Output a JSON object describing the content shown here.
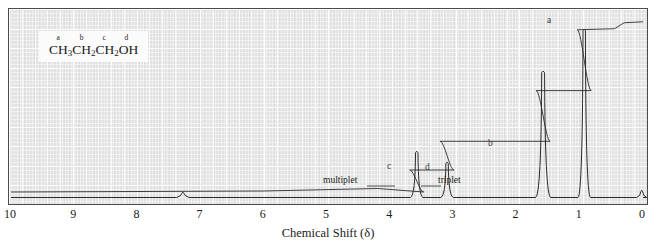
{
  "figure": {
    "compound_label": {
      "letters": [
        {
          "text": "a",
          "pos": 0.085
        },
        {
          "text": "b",
          "pos": 0.345
        },
        {
          "text": "c",
          "pos": 0.6
        },
        {
          "text": "d",
          "pos": 0.845
        }
      ],
      "formula_parts": [
        {
          "text": "CH",
          "sub": "3"
        },
        {
          "text": "CH",
          "sub": "2"
        },
        {
          "text": "CH",
          "sub": "2"
        },
        {
          "text": "OH",
          "sub": ""
        }
      ],
      "formula_plain": "CH3CH2CH2OH"
    },
    "annotations": [
      {
        "name": "multiplet",
        "text": "multiplet",
        "x": 322,
        "y": 180,
        "line_to": 385
      },
      {
        "name": "triplet",
        "text": "triplet",
        "x": 437,
        "y": 180,
        "line_from": 412
      }
    ],
    "peak_letters": [
      {
        "text": "a",
        "x": 546,
        "y": 14
      },
      {
        "text": "b",
        "x": 487,
        "y": 137
      },
      {
        "text": "c",
        "x": 386,
        "y": 160
      },
      {
        "text": "d",
        "x": 424,
        "y": 161
      }
    ],
    "colors": {
      "plot_background": "#e2e2e2",
      "grid": "#ffffff",
      "trace": "#2b2b2b",
      "frame": "#4a4a4a",
      "text": "#1a1a1a"
    }
  },
  "chart_data": {
    "type": "line",
    "title": "",
    "xlabel": "Chemical Shift (δ)",
    "ylabel": "",
    "unit_label": "ppm",
    "xlim": [
      10,
      0
    ],
    "x_tick_labels": [
      "10",
      "9",
      "8",
      "7",
      "6",
      "5",
      "4",
      "3",
      "2",
      "1",
      "0"
    ],
    "x_ticks": [
      10,
      9,
      8,
      7,
      6,
      5,
      4,
      3,
      2,
      1,
      0
    ],
    "grid": true,
    "legend": null,
    "series": [
      {
        "name": "1H NMR spectrum",
        "peaks": [
          {
            "label": "a",
            "assignment": "CH3",
            "shift_ppm": 0.93,
            "multiplicity": "triplet",
            "relative_height": 0.93,
            "width_ppm": 0.05
          },
          {
            "label": "b",
            "assignment": "CH2 (middle)",
            "shift_ppm": 1.58,
            "multiplicity": "multiplet",
            "relative_height": 0.7,
            "width_ppm": 0.06
          },
          {
            "label": "c",
            "assignment": "OH",
            "shift_ppm": 3.58,
            "multiplicity": "multiplet",
            "relative_height": 0.26,
            "width_ppm": 0.05
          },
          {
            "label": "d",
            "assignment": "CH2-OH",
            "shift_ppm": 3.1,
            "multiplicity": "triplet",
            "relative_height": 0.2,
            "width_ppm": 0.05
          },
          {
            "label": "solvent",
            "assignment": "residual solvent",
            "shift_ppm": 7.28,
            "multiplicity": "singlet",
            "relative_height": 0.035,
            "width_ppm": 0.05
          },
          {
            "label": "TMS",
            "assignment": "TMS reference",
            "shift_ppm": 0.02,
            "multiplicity": "singlet",
            "relative_height": 0.045,
            "width_ppm": 0.04
          }
        ]
      },
      {
        "name": "integration curve",
        "steps": [
          {
            "shift_ppm": 3.58,
            "rise": 0.13
          },
          {
            "shift_ppm": 3.1,
            "rise": 0.17
          },
          {
            "shift_ppm": 1.58,
            "rise": 0.3
          },
          {
            "shift_ppm": 0.93,
            "rise": 0.36
          }
        ]
      }
    ]
  }
}
